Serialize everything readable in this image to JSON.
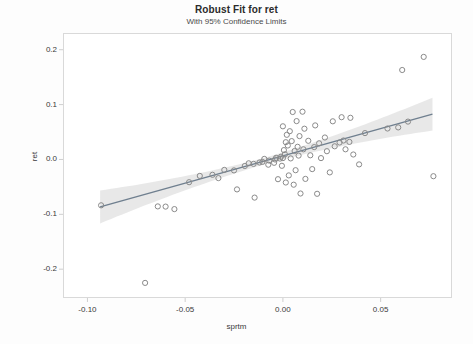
{
  "chart_data": {
    "type": "scatter",
    "title": "Robust Fit for ret",
    "subtitle": "With 95% Confidence Limits",
    "xlabel": "sprtm",
    "ylabel": "ret",
    "xlim": [
      -0.1125,
      0.0865
    ],
    "ylim": [
      -0.2525,
      0.2305
    ],
    "xticks": [
      -0.1,
      -0.05,
      0.0,
      0.05
    ],
    "xtick_labels": [
      "-0.10",
      "-0.05",
      "0.00",
      "0.05"
    ],
    "yticks": [
      0.2,
      0.1,
      0.0,
      -0.1,
      -0.2
    ],
    "ytick_labels": [
      "0.2",
      "0.1",
      "0.0",
      "-0.1",
      "-0.2"
    ],
    "grid": false,
    "legend": false,
    "marker": "open-circle",
    "marker_color": "#8a8a8a",
    "fit": {
      "type": "robust-linear",
      "intercept": 0.0065,
      "slope": 0.995,
      "x_start": -0.0935,
      "x_end": 0.0765,
      "line_color": "#6f7f8f",
      "band_color": "#c9c9c9",
      "band_label": "95% Confidence Limits",
      "band_halfwidth_center": 0.006,
      "band_halfwidth_end": 0.03
    },
    "points": [
      [
        -0.093,
        -0.0835
      ],
      [
        -0.0705,
        -0.225
      ],
      [
        -0.064,
        -0.0855
      ],
      [
        -0.06,
        -0.086
      ],
      [
        -0.0555,
        -0.0905
      ],
      [
        -0.048,
        -0.0415
      ],
      [
        -0.0425,
        -0.03
      ],
      [
        -0.036,
        -0.028
      ],
      [
        -0.033,
        -0.034
      ],
      [
        -0.03,
        -0.019
      ],
      [
        -0.025,
        -0.02
      ],
      [
        -0.0235,
        -0.0545
      ],
      [
        -0.0195,
        -0.012
      ],
      [
        -0.0175,
        -0.007
      ],
      [
        -0.015,
        -0.008
      ],
      [
        -0.0145,
        -0.0695
      ],
      [
        -0.012,
        -0.0055
      ],
      [
        -0.0105,
        -0.0045
      ],
      [
        -0.0095,
        0.001
      ],
      [
        -0.0075,
        -0.0095
      ],
      [
        -0.007,
        -0.002
      ],
      [
        -0.0045,
        -0.006
      ],
      [
        -0.004,
        0.0
      ],
      [
        -0.0035,
        0.003
      ],
      [
        -0.0025,
        -0.036
      ],
      [
        -0.0015,
        0.0015
      ],
      [
        -0.001,
        0.005
      ],
      [
        -0.0005,
        -0.0115
      ],
      [
        0.0,
        0.0025
      ],
      [
        0.0,
        0.0605
      ],
      [
        0.0005,
        0.017
      ],
      [
        0.001,
        0.0095
      ],
      [
        0.0015,
        0.0315
      ],
      [
        0.0015,
        -0.042
      ],
      [
        0.002,
        0.045
      ],
      [
        0.0025,
        0.0255
      ],
      [
        0.003,
        -0.029
      ],
      [
        0.0035,
        0.0515
      ],
      [
        0.004,
        0.002
      ],
      [
        0.0045,
        0.0335
      ],
      [
        0.005,
        0.0865
      ],
      [
        0.0055,
        -0.046
      ],
      [
        0.006,
        0.0155
      ],
      [
        0.0065,
        -0.0195
      ],
      [
        0.007,
        0.07
      ],
      [
        0.0075,
        0.023
      ],
      [
        0.008,
        0.007
      ],
      [
        0.0085,
        0.0425
      ],
      [
        0.009,
        -0.062
      ],
      [
        0.01,
        0.087
      ],
      [
        0.0105,
        0.0185
      ],
      [
        0.011,
        0.056
      ],
      [
        0.0115,
        -0.0355
      ],
      [
        0.013,
        0.034
      ],
      [
        0.014,
        0.0075
      ],
      [
        0.015,
        -0.0175
      ],
      [
        0.016,
        0.0225
      ],
      [
        0.0165,
        0.062
      ],
      [
        0.0175,
        -0.0625
      ],
      [
        0.0185,
        0.0295
      ],
      [
        0.0195,
        0.0025
      ],
      [
        0.0215,
        0.04
      ],
      [
        0.0225,
        0.015
      ],
      [
        0.024,
        -0.0235
      ],
      [
        0.0255,
        0.0695
      ],
      [
        0.0265,
        0.024
      ],
      [
        0.029,
        0.031
      ],
      [
        0.03,
        0.077
      ],
      [
        0.031,
        0.0345
      ],
      [
        0.032,
        0.0185
      ],
      [
        0.034,
        0.032
      ],
      [
        0.0345,
        0.076
      ],
      [
        0.036,
        0.009
      ],
      [
        0.039,
        -0.009
      ],
      [
        0.042,
        0.048
      ],
      [
        0.0535,
        0.0565
      ],
      [
        0.059,
        0.0585
      ],
      [
        0.061,
        0.163
      ],
      [
        0.064,
        0.069
      ],
      [
        0.072,
        0.187
      ],
      [
        0.077,
        -0.0305
      ]
    ]
  }
}
